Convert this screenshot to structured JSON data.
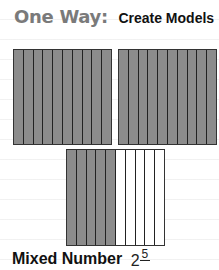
{
  "title": {
    "lead": "One Way:",
    "sub": "Create Models"
  },
  "models": [
    {
      "name": "whole-1",
      "parts": 10,
      "shaded": 10
    },
    {
      "name": "whole-2",
      "parts": 10,
      "shaded": 10
    },
    {
      "name": "partial",
      "parts": 10,
      "shaded": 5
    }
  ],
  "colors": {
    "shaded": "#8c8c8c",
    "empty": "#ffffff",
    "lead_text": "#7a7a7a"
  },
  "mixed_number": {
    "label": "Mixed Number",
    "whole": "2",
    "numerator": "5"
  }
}
